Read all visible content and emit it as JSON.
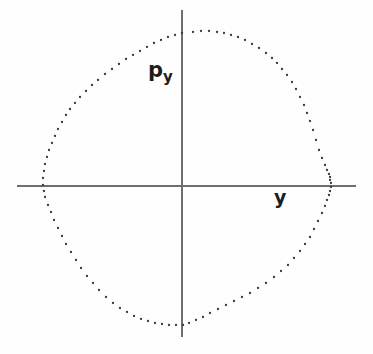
{
  "figure": {
    "background_color": "#fefefe",
    "axis_color": "#6e6e72",
    "dot_color": "#3a3a3e",
    "text_color": "#1d1d1f"
  },
  "labels": {
    "vertical_axis_base": "p",
    "vertical_axis_subscript": "y",
    "horizontal_axis": "y"
  },
  "chart_data": {
    "type": "scatter",
    "title": "",
    "subtitle": "",
    "xlabel": "y",
    "ylabel": "p_y",
    "grid": false,
    "legend": null,
    "annotations": [
      {
        "text": "p",
        "subscript": "y",
        "x_px": 158,
        "y_px": 70,
        "role": "vertical-axis-label"
      },
      {
        "text": "y",
        "x_px": 281,
        "y_px": 196,
        "role": "horizontal-axis-label"
      }
    ],
    "axes": {
      "origin_px": [
        182,
        186
      ],
      "x_axis_extent_px": [
        17,
        356
      ],
      "y_axis_extent_px": [
        10,
        337
      ],
      "xlim": [
        -1.1,
        1.1
      ],
      "ylim": [
        -1.05,
        1.05
      ],
      "ticks_shown": false
    },
    "series": [
      {
        "name": "invariant-curve",
        "marker": "point",
        "color": "#3a3a3e",
        "points_px": [
          [
            193,
            32
          ],
          [
            201,
            31
          ],
          [
            209,
            31
          ],
          [
            217,
            32
          ],
          [
            224,
            33
          ],
          [
            231,
            35
          ],
          [
            238,
            37
          ],
          [
            245,
            40
          ],
          [
            252,
            44
          ],
          [
            259,
            48
          ],
          [
            266,
            53
          ],
          [
            272,
            58
          ],
          [
            277,
            63
          ],
          [
            282,
            69
          ],
          [
            287,
            75
          ],
          [
            292,
            82
          ],
          [
            296,
            89
          ],
          [
            300,
            97
          ],
          [
            304,
            105
          ],
          [
            307,
            113
          ],
          [
            310,
            121
          ],
          [
            313,
            130
          ],
          [
            316,
            140
          ],
          [
            319,
            150
          ],
          [
            322,
            158
          ],
          [
            325,
            165
          ],
          [
            327,
            170
          ],
          [
            329,
            174
          ],
          [
            330,
            177
          ],
          [
            330,
            180
          ],
          [
            331,
            183
          ],
          [
            331,
            187
          ],
          [
            330,
            191
          ],
          [
            329,
            195
          ],
          [
            327,
            200
          ],
          [
            325,
            206
          ],
          [
            322,
            213
          ],
          [
            318,
            221
          ],
          [
            314,
            229
          ],
          [
            310,
            237
          ],
          [
            305,
            244
          ],
          [
            300,
            251
          ],
          [
            294,
            258
          ],
          [
            288,
            265
          ],
          [
            281,
            271
          ],
          [
            274,
            277
          ],
          [
            266,
            283
          ],
          [
            258,
            288
          ],
          [
            250,
            293
          ],
          [
            242,
            297
          ],
          [
            234,
            301
          ],
          [
            226,
            305
          ],
          [
            218,
            309
          ],
          [
            210,
            313
          ],
          [
            203,
            317
          ],
          [
            196,
            320
          ],
          [
            189,
            323
          ],
          [
            183,
            325
          ],
          [
            176,
            325
          ],
          [
            169,
            325
          ],
          [
            162,
            324
          ],
          [
            155,
            323
          ],
          [
            148,
            321
          ],
          [
            141,
            319
          ],
          [
            134,
            316
          ],
          [
            127,
            312
          ],
          [
            120,
            308
          ],
          [
            113,
            303
          ],
          [
            106,
            297
          ],
          [
            99,
            290
          ],
          [
            93,
            283
          ],
          [
            87,
            276
          ],
          [
            81,
            268
          ],
          [
            76,
            260
          ],
          [
            71,
            252
          ],
          [
            66,
            244
          ],
          [
            62,
            236
          ],
          [
            58,
            228
          ],
          [
            54,
            220
          ],
          [
            51,
            212
          ],
          [
            48,
            205
          ],
          [
            45,
            197
          ],
          [
            44,
            191
          ],
          [
            43,
            185
          ],
          [
            43,
            178
          ],
          [
            44,
            171
          ],
          [
            45,
            164
          ],
          [
            47,
            157
          ],
          [
            49,
            150
          ],
          [
            52,
            143
          ],
          [
            55,
            136
          ],
          [
            58,
            129
          ],
          [
            62,
            122
          ],
          [
            66,
            115
          ],
          [
            70,
            109
          ],
          [
            75,
            103
          ],
          [
            80,
            97
          ],
          [
            86,
            91
          ],
          [
            92,
            85
          ],
          [
            98,
            80
          ],
          [
            105,
            74
          ],
          [
            112,
            69
          ],
          [
            119,
            64
          ],
          [
            126,
            59
          ],
          [
            133,
            55
          ],
          [
            140,
            51
          ],
          [
            147,
            47
          ],
          [
            154,
            43
          ],
          [
            161,
            40
          ],
          [
            168,
            37
          ],
          [
            175,
            35
          ],
          [
            182,
            33
          ]
        ]
      }
    ]
  }
}
